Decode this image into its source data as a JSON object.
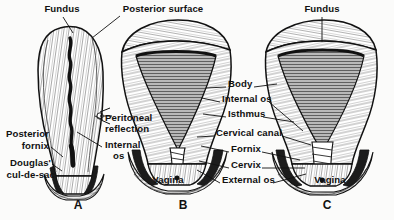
{
  "plate": {
    "title": "Uterus sections A, B, C",
    "background_color": "#fbfbfa",
    "ink_color": "#111111"
  },
  "figures": [
    {
      "id": "A",
      "label": "A",
      "caption_x": 78,
      "caption_y": 198,
      "view": "sagittal-section"
    },
    {
      "id": "B",
      "label": "B",
      "caption_x": 183,
      "caption_y": 198,
      "view": "coronal-section"
    },
    {
      "id": "C",
      "label": "C",
      "caption_x": 327,
      "caption_y": 198,
      "view": "coronal-section"
    }
  ],
  "labels": [
    {
      "name": "fundus-left",
      "text": "Fundus",
      "x": 62,
      "y": 6,
      "align": "center",
      "leader": [
        [
          62,
          18
        ],
        [
          72,
          30
        ]
      ]
    },
    {
      "name": "posterior-surface",
      "text": "Posterior surface",
      "x": 163,
      "y": 6,
      "align": "center",
      "leader": [
        [
          118,
          16
        ],
        [
          92,
          36
        ]
      ]
    },
    {
      "name": "fundus-right",
      "text": "Fundus",
      "x": 322,
      "y": 6,
      "align": "center",
      "leader": [
        [
          322,
          18
        ],
        [
          322,
          40
        ]
      ]
    },
    {
      "name": "peritoneal-reflection-line1",
      "text": "Peritoneal",
      "x": 105,
      "y": 117,
      "align": "left",
      "leader": [
        [
          104,
          122
        ],
        [
          92,
          113
        ]
      ]
    },
    {
      "name": "peritoneal-reflection-line2",
      "text": "reflection",
      "x": 105,
      "y": 128,
      "align": "left",
      "leader": null
    },
    {
      "name": "internal-os-left",
      "text": "Internal",
      "x": 105,
      "y": 143,
      "align": "left",
      "leader": [
        [
          103,
          148
        ],
        [
          78,
          128
        ]
      ]
    },
    {
      "name": "internal-os-left-line2",
      "text": "os",
      "x": 112,
      "y": 155,
      "align": "left",
      "leader": null
    },
    {
      "name": "posterior-fornix-line1",
      "text": "Posterior",
      "x": 48,
      "y": 132,
      "align": "right",
      "leader": null
    },
    {
      "name": "posterior-fornix-line2",
      "text": "fornix",
      "x": 48,
      "y": 144,
      "align": "right",
      "leader": [
        [
          50,
          148
        ],
        [
          64,
          156
        ]
      ]
    },
    {
      "name": "douglas-cul-de-sac-line1",
      "text": "Douglas'",
      "x": 50,
      "y": 161,
      "align": "right",
      "leader": [
        [
          51,
          166
        ],
        [
          62,
          172
        ]
      ]
    },
    {
      "name": "douglas-cul-de-sac-line2",
      "text": "cul-de-sac",
      "x": 54,
      "y": 173,
      "align": "right",
      "leader": null
    },
    {
      "name": "body",
      "text": "Body",
      "x": 228,
      "y": 82,
      "align": "left",
      "leader_left": [
        [
          226,
          87
        ],
        [
          205,
          89
        ]
      ],
      "leader_right": [
        [
          253,
          87
        ],
        [
          276,
          83
        ]
      ]
    },
    {
      "name": "internal-os-center",
      "text": "Internal os",
      "x": 222,
      "y": 97,
      "align": "left",
      "leader_left": [
        [
          220,
          102
        ],
        [
          202,
          99
        ]
      ],
      "leader_right": [
        [
          268,
          102
        ],
        [
          300,
          128
        ]
      ]
    },
    {
      "name": "isthmus",
      "text": "Isthmus",
      "x": 228,
      "y": 112,
      "align": "left",
      "leader_left": [
        [
          226,
          117
        ],
        [
          202,
          113
        ]
      ],
      "leader_right": [
        [
          262,
          117
        ],
        [
          292,
          120
        ]
      ]
    },
    {
      "name": "cervical-canal",
      "text": "Cervical canal",
      "x": 216,
      "y": 131,
      "align": "left",
      "leader_left": [
        [
          214,
          136
        ],
        [
          196,
          136
        ]
      ],
      "leader_right": [
        [
          281,
          136
        ],
        [
          310,
          142
        ]
      ]
    },
    {
      "name": "fornix",
      "text": "Fornix",
      "x": 231,
      "y": 147,
      "align": "left",
      "leader_left": [
        [
          229,
          152
        ],
        [
          200,
          145
        ]
      ],
      "leader_right": [
        [
          261,
          152
        ],
        [
          299,
          160
        ]
      ]
    },
    {
      "name": "cervix",
      "text": "Cervix",
      "x": 231,
      "y": 163,
      "align": "left",
      "leader_left": [
        [
          229,
          168
        ],
        [
          198,
          160
        ]
      ],
      "leader_right": [
        [
          261,
          168
        ],
        [
          304,
          166
        ]
      ]
    },
    {
      "name": "external-os",
      "text": "External os",
      "x": 222,
      "y": 178,
      "align": "left",
      "leader_left": [
        [
          220,
          183
        ],
        [
          196,
          168
        ]
      ],
      "leader_right": [
        [
          272,
          183
        ],
        [
          304,
          172
        ]
      ]
    },
    {
      "name": "vagina-b",
      "text": "Vagina",
      "x": 168,
      "y": 178,
      "align": "center",
      "leader": null
    },
    {
      "name": "vagina-c",
      "text": "Vagina",
      "x": 330,
      "y": 178,
      "align": "center",
      "leader": null
    }
  ]
}
